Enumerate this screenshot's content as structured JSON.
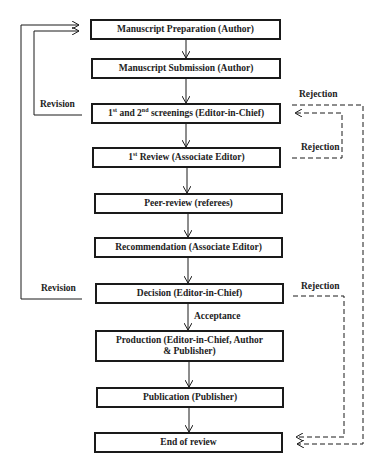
{
  "diagram": {
    "type": "flowchart",
    "nodes": [
      {
        "id": "prep",
        "label": "Manuscript Preparation (Author)"
      },
      {
        "id": "submit",
        "label": "Manuscript Submission (Author)"
      },
      {
        "id": "screen",
        "label_parts": [
          "1",
          "st",
          " and 2",
          "nd",
          " screenings (Editor-in-Chief)"
        ]
      },
      {
        "id": "review1",
        "label_parts": [
          "1",
          "st",
          " Review (Associate Editor)"
        ]
      },
      {
        "id": "peer",
        "label": "Peer-review (referees)"
      },
      {
        "id": "recommend",
        "label": "Recommendation (Associate Editor)"
      },
      {
        "id": "decision",
        "label": "Decision (Editor-in-Chief)"
      },
      {
        "id": "production",
        "label": "Production (Editor-in-Chief, Author & Publisher)"
      },
      {
        "id": "publication",
        "label": "Publication (Publisher)"
      },
      {
        "id": "end",
        "label": "End of review"
      }
    ],
    "edge_labels": {
      "revision_top": "Revision",
      "revision_bottom": "Revision",
      "rejection_screen": "Rejection",
      "rejection_review1": "Rejection",
      "rejection_decision": "Rejection",
      "acceptance": "Acceptance"
    },
    "edges": [
      {
        "from": "prep",
        "to": "submit",
        "style": "solid"
      },
      {
        "from": "submit",
        "to": "screen",
        "style": "solid"
      },
      {
        "from": "screen",
        "to": "review1",
        "style": "solid"
      },
      {
        "from": "review1",
        "to": "peer",
        "style": "solid"
      },
      {
        "from": "peer",
        "to": "recommend",
        "style": "solid"
      },
      {
        "from": "recommend",
        "to": "decision",
        "style": "solid"
      },
      {
        "from": "decision",
        "to": "production",
        "style": "solid",
        "label": "Acceptance"
      },
      {
        "from": "production",
        "to": "publication",
        "style": "solid"
      },
      {
        "from": "publication",
        "to": "end",
        "style": "solid"
      },
      {
        "from": "screen",
        "to": "prep",
        "style": "solid",
        "label": "Revision"
      },
      {
        "from": "decision",
        "to": "prep",
        "style": "solid",
        "label": "Revision"
      },
      {
        "from": "review1",
        "to": "screen",
        "style": "dashed",
        "label": "Rejection"
      },
      {
        "from": "screen",
        "to": "end",
        "style": "dashed",
        "label": "Rejection"
      },
      {
        "from": "decision",
        "to": "end",
        "style": "dashed",
        "label": "Rejection"
      }
    ]
  }
}
